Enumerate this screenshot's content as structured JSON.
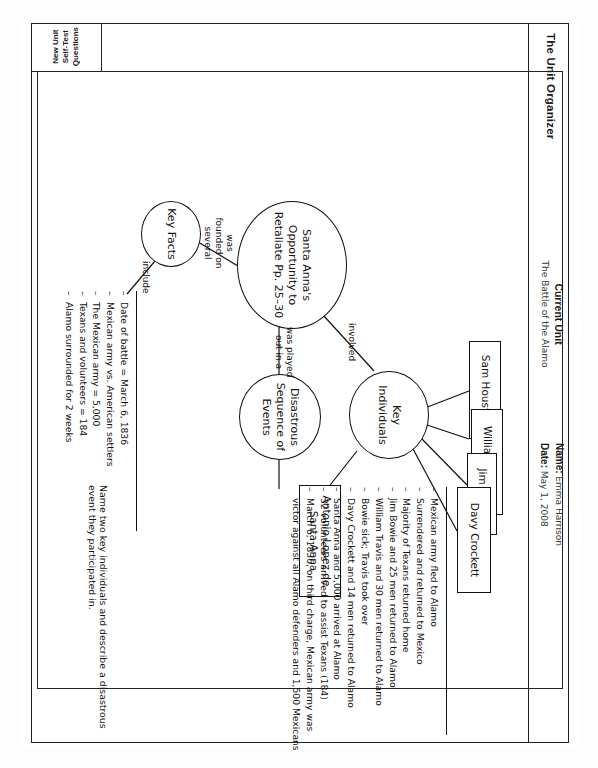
{
  "header": {
    "organizer_title": "The Unit Organizer",
    "current_unit_label": "Current Unit",
    "current_unit_value": "The Battle of the Alamo",
    "name_label": "Name:",
    "name_value": "Emma Harrison",
    "date_label": "Date:",
    "date_value": "May 1, 2008"
  },
  "side_tab": {
    "line1": "New Unit",
    "line2": "Self-Test",
    "line3": "Questions"
  },
  "nodes": {
    "center": "Santa Anna's Opportunity to Retaliate Pp. 25–30",
    "key_individuals": "Key Individuals",
    "disastrous_sequence": "Disastrous Sequence of Events",
    "key_facts": "Key Facts"
  },
  "people_boxes": [
    "Sam Houston",
    "William Travis",
    "Jim Bowie",
    "Davy Crockett",
    "Antonio Lopez de Santa Anna"
  ],
  "connector_labels": {
    "involved": "involved",
    "was_played_out_in_a": "was played out in a",
    "was_founded_on_several": "was founded on several",
    "include": "include"
  },
  "key_facts_list": [
    "Date of battle = March 6, 1836",
    "Mexican army vs. American settlers",
    "The Mexican army = 5,000",
    "Texans and volunteers = 184",
    "Alamo surrounded for 2 weeks"
  ],
  "sequence_list": [
    "Mexican army fled to Alamo",
    "Surrendered and returned to Mexico",
    "Majority of Texans returned home",
    "Jim Bowie and 25 men returned to Alamo",
    "William Travis and 30 men returned to Alamo",
    "Bowie sick; Travis took over",
    "Davy Crockett and 14 men returned to Alamo",
    "Santa Anna and 5,000 arrived at Alamo",
    "32 volunteers arrived to assist Texans (184)"
  ],
  "sequence_last": {
    "line1": "March 6, 1836, on third charge, Mexican army was",
    "line2": "victor against all Alamo defenders and 1,500 Mexicans"
  },
  "self_test_question": "Name two key individuals and describe a disastrous event they participated in."
}
